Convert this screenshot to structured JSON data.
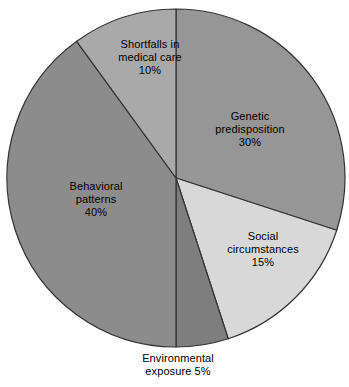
{
  "chart_data": {
    "type": "pie",
    "title": "",
    "subtitle": "",
    "xlabel": "",
    "ylabel": "",
    "legend_position": "none",
    "grid": false,
    "start_angle_deg": 0,
    "direction": "clockwise",
    "unit": "%",
    "categories": [
      "Genetic predisposition",
      "Social circumstances",
      "Environmental exposure",
      "Behavioral patterns",
      "Shortfalls in medical care"
    ],
    "values": [
      30,
      15,
      5,
      40,
      10
    ],
    "slices": [
      {
        "name": "genetic-predisposition",
        "label_lines": [
          "Genetic",
          "predisposition",
          "30%"
        ],
        "value": 30,
        "value_text": "30%",
        "color": "#969696",
        "label_placement": "inside"
      },
      {
        "name": "social-circumstances",
        "label_lines": [
          "Social",
          "circumstances",
          "15%"
        ],
        "value": 15,
        "value_text": "15%",
        "color": "#d8d8d8",
        "label_placement": "inside"
      },
      {
        "name": "environmental-exposure",
        "label_lines": [
          "Environmental",
          "exposure 5%"
        ],
        "value": 5,
        "value_text": "5%",
        "color": "#7e7e7e",
        "label_placement": "outside-bottom"
      },
      {
        "name": "behavioral-patterns",
        "label_lines": [
          "Behavioral",
          "patterns",
          "40%"
        ],
        "value": 40,
        "value_text": "40%",
        "color": "#8c8c8c",
        "label_placement": "inside"
      },
      {
        "name": "shortfalls-in-medical-care",
        "label_lines": [
          "Shortfalls in",
          "medical care",
          "10%"
        ],
        "value": 10,
        "value_text": "10%",
        "color": "#a9a9a9",
        "label_placement": "inside"
      }
    ],
    "outline_color": "#333333",
    "background_color": "#ffffff"
  },
  "labels": {
    "genetic": {
      "line1": "Genetic",
      "line2": "predisposition",
      "line3": "30%"
    },
    "social": {
      "line1": "Social",
      "line2": "circumstances",
      "line3": "15%"
    },
    "behavioral": {
      "line1": "Behavioral",
      "line2": "patterns",
      "line3": "40%"
    },
    "shortfalls": {
      "line1": "Shortfalls in",
      "line2": "medical care",
      "line3": "10%"
    },
    "environmental": {
      "line1": "Environmental",
      "line2": "exposure 5%"
    }
  }
}
